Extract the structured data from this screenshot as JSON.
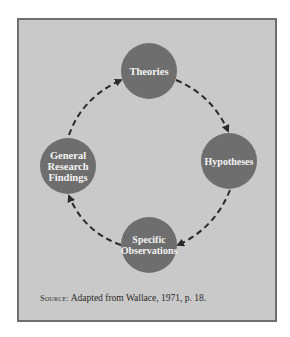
{
  "diagram": {
    "type": "cycle",
    "nodes": [
      {
        "id": "theories",
        "lines": [
          "Theories"
        ]
      },
      {
        "id": "hypotheses",
        "lines": [
          "Hypotheses"
        ]
      },
      {
        "id": "specific-observations",
        "lines": [
          "Specific",
          "Observations"
        ]
      },
      {
        "id": "general-research-findings",
        "lines": [
          "General",
          "Research",
          "Findings"
        ]
      }
    ],
    "edges": [
      {
        "from": "theories",
        "to": "hypotheses",
        "style": "dashed-arrow"
      },
      {
        "from": "hypotheses",
        "to": "specific-observations",
        "style": "dashed-arrow"
      },
      {
        "from": "specific-observations",
        "to": "general-research-findings",
        "style": "dashed-arrow"
      },
      {
        "from": "general-research-findings",
        "to": "theories",
        "style": "dashed-arrow"
      }
    ],
    "colors": {
      "background": "#c9c9c9",
      "border": "#6f6f6f",
      "node_fill": "#6e6e6e",
      "node_text": "#f4f4f4",
      "arrow": "#2b2b2b"
    }
  },
  "source": {
    "label": "Source:",
    "text": "Adapted from Wallace, 1971, p. 18."
  }
}
